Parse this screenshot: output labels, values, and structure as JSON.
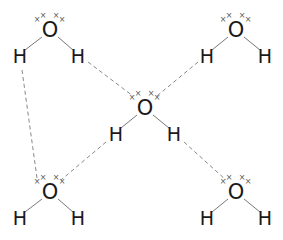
{
  "diagram": {
    "title": "",
    "colors": {
      "atom": "#1a1a1a",
      "bond": "#777777",
      "hydrogen_bond": "#888888",
      "lone_pair": "#555555"
    },
    "lone_pair_symbol": "×",
    "molecules": [
      {
        "id": "top-left",
        "O": {
          "label": "O",
          "x": 50,
          "y": 30
        },
        "H1": {
          "label": "H",
          "x": 20,
          "y": 56
        },
        "H2": {
          "label": "H",
          "x": 78,
          "y": 56
        }
      },
      {
        "id": "top-right",
        "O": {
          "label": "O",
          "x": 236,
          "y": 30
        },
        "H1": {
          "label": "H",
          "x": 207,
          "y": 56
        },
        "H2": {
          "label": "H",
          "x": 265,
          "y": 56
        }
      },
      {
        "id": "center",
        "O": {
          "label": "O",
          "x": 145,
          "y": 108
        },
        "H1": {
          "label": "H",
          "x": 116,
          "y": 134
        },
        "H2": {
          "label": "H",
          "x": 174,
          "y": 134
        }
      },
      {
        "id": "bottom-left",
        "O": {
          "label": "O",
          "x": 50,
          "y": 192
        },
        "H1": {
          "label": "H",
          "x": 20,
          "y": 218
        },
        "H2": {
          "label": "H",
          "x": 78,
          "y": 218
        }
      },
      {
        "id": "bottom-right",
        "O": {
          "label": "O",
          "x": 236,
          "y": 192
        },
        "H1": {
          "label": "H",
          "x": 207,
          "y": 218
        },
        "H2": {
          "label": "H",
          "x": 265,
          "y": 218
        }
      }
    ],
    "hydrogen_bonds": [
      {
        "from": "top-left.H2",
        "to": "center.O"
      },
      {
        "from": "top-right.H1",
        "to": "center.O"
      },
      {
        "from": "center.H1",
        "to": "bottom-left.O"
      },
      {
        "from": "center.H2",
        "to": "bottom-right.O"
      },
      {
        "from": "top-left.H1",
        "to": "bottom-left.O"
      }
    ]
  }
}
